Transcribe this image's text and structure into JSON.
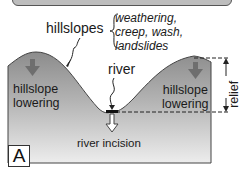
{
  "diagram": {
    "panel_label": "A",
    "labels": {
      "hillslopes": "hillslopes",
      "processes": [
        "weathering,",
        "creep, wash,",
        "landslides"
      ],
      "river": "river",
      "hillslope_lowering_left": [
        "hillslope",
        "lowering"
      ],
      "hillslope_lowering_right": [
        "hillslope",
        "lowering"
      ],
      "relief": "relief",
      "river_incision": "river incision"
    },
    "colors": {
      "terrain_top": "#8f8f8f",
      "terrain_bottom": "#e9e9e9",
      "arrow_fill": "#6e6e6e",
      "outline": "#333333",
      "title_box": "#bdbdbd"
    }
  }
}
